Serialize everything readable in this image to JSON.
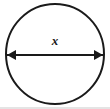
{
  "figure": {
    "name": "circle-with-diameter-label",
    "background_color": "#ffffff",
    "stroke_color": "#1a1a1a",
    "label_color": "#1a1a1a",
    "canvas": {
      "width": 110,
      "height": 109
    },
    "circle": {
      "name": "circle-outline",
      "center_x": 55,
      "center_y": 54,
      "radius_x": 49,
      "radius_y": 50,
      "stroke_width": 2,
      "fill": "none"
    },
    "diameter_arrow": {
      "name": "diameter-double-arrow",
      "x_start": 7,
      "x_end": 103,
      "y": 55,
      "stroke_width": 2,
      "arrowhead_length": 9,
      "arrowhead_half_height": 5,
      "left_head": "solid-triangle-left",
      "right_head": "solid-triangle-right"
    },
    "label": {
      "name": "diameter-label",
      "text": "x",
      "x": 55,
      "y": 42,
      "font_size": 13,
      "italic": true,
      "bold": true
    },
    "baseline_rule": {
      "name": "bottom-rule",
      "x_start": 0,
      "x_end": 110,
      "y": 108,
      "color": "#c9c9c9",
      "stroke_width": 1
    }
  }
}
